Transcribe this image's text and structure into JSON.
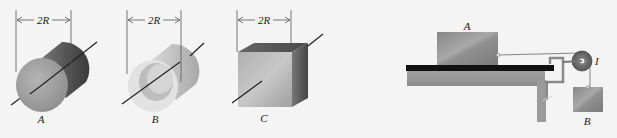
{
  "figure_left": {
    "dimension_label": "2R",
    "objects": [
      {
        "id": "A",
        "label": "A",
        "shape": "solid cylinder"
      },
      {
        "id": "B",
        "label": "B",
        "shape": "hollow cylinder"
      },
      {
        "id": "C",
        "label": "C",
        "shape": "cube"
      }
    ]
  },
  "figure_right": {
    "block_top_label": "A",
    "pulley_label": "I",
    "hanging_block_label": "B"
  },
  "colors": {
    "background": "#f4f4f4",
    "object_gray": "#9a9a9a",
    "dark_gray": "#555555",
    "table_top": "#111111",
    "line": "#222222"
  }
}
